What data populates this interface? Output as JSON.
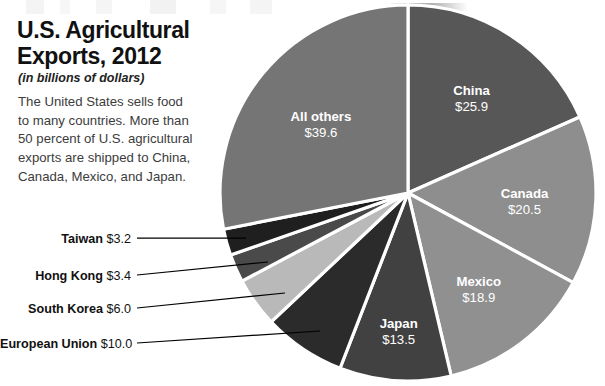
{
  "headline": "U.S. Agricultural Exports, 2012",
  "subhead": "(in billions of dollars)",
  "blurb": "The United States sells food to many countries. More than 50 percent of U.S. agricultural exports are shipped to China, Canada, Mexico, and Japan.",
  "chart_data": {
    "type": "pie",
    "title": "U.S. Agricultural Exports, 2012",
    "subtitle": "(in billions of dollars)",
    "unit": "billions of dollars",
    "value_prefix": "$",
    "total": 140.6,
    "start_angle_deg": 0,
    "direction": "clockwise",
    "legend": "none",
    "labels_inside": true,
    "slices": [
      {
        "name": "China",
        "value": 25.9,
        "display": "$25.9",
        "color": "#575757",
        "label_placement": "inside"
      },
      {
        "name": "Canada",
        "value": 20.5,
        "display": "$20.5",
        "color": "#8e8e8e",
        "label_placement": "inside"
      },
      {
        "name": "Mexico",
        "value": 18.9,
        "display": "$18.9",
        "color": "#909090",
        "label_placement": "inside"
      },
      {
        "name": "Japan",
        "value": 13.5,
        "display": "$13.5",
        "color": "#414141",
        "label_placement": "inside"
      },
      {
        "name": "European Union",
        "value": 10.0,
        "display": "$10.0",
        "color": "#2b2b2b",
        "label_placement": "callout"
      },
      {
        "name": "South Korea",
        "value": 6.0,
        "display": "$6.0",
        "color": "#b9b9b9",
        "label_placement": "callout"
      },
      {
        "name": "Hong Kong",
        "value": 3.4,
        "display": "$3.4",
        "color": "#4a4a4a",
        "label_placement": "callout"
      },
      {
        "name": "Taiwan",
        "value": 3.2,
        "display": "$3.2",
        "color": "#1f1f1f",
        "label_placement": "callout"
      },
      {
        "name": "All others",
        "value": 39.6,
        "display": "$39.6",
        "color": "#757575",
        "label_placement": "inside"
      }
    ]
  }
}
